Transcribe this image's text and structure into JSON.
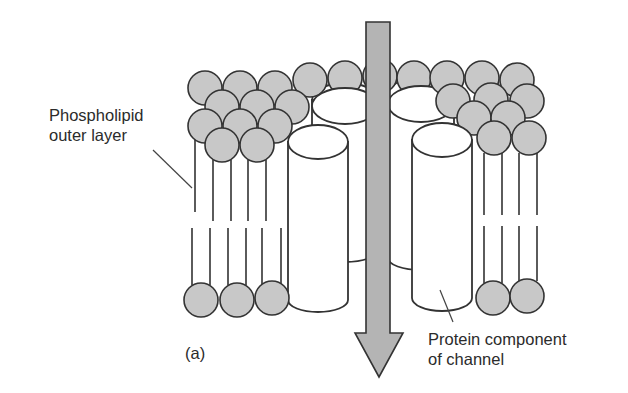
{
  "diagram": {
    "type": "membrane ion channel cross-section",
    "labels": {
      "phospholipid": {
        "line1": "Phospholipid",
        "line2": "outer layer"
      },
      "protein": {
        "line1": "Protein component",
        "line2": "of channel"
      },
      "panel": "(a)"
    },
    "colors": {
      "head_fill": "#c8c8c8",
      "stroke": "#333333",
      "arrow_fill": "#b4b4b4",
      "cylinder_fill": "#ffffff",
      "text": "#2b2b2b"
    },
    "elements": {
      "arrow": {
        "direction": "down",
        "meaning": "ion flow through channel"
      },
      "protein_cylinders": 4,
      "phospholipid_heads_top": 28,
      "phospholipid_heads_bottom": 5
    }
  }
}
